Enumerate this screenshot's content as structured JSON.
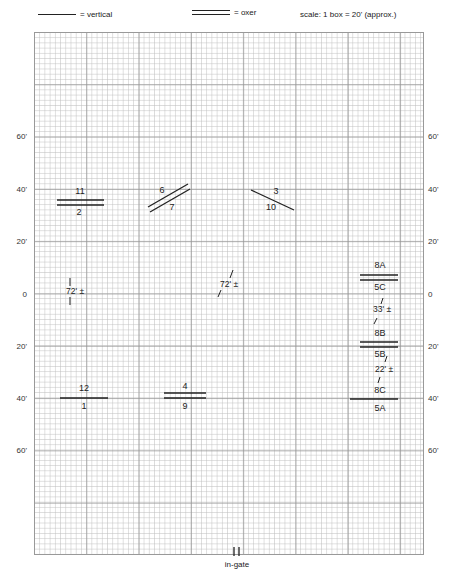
{
  "legend": {
    "vertical_label": "= vertical",
    "oxer_label": "= oxer",
    "scale_label": "scale: 1 box = 20' (approx.)"
  },
  "axis": {
    "left": [
      {
        "label": "60'",
        "y": 137
      },
      {
        "label": "40'",
        "y": 190
      },
      {
        "label": "20'",
        "y": 242
      },
      {
        "label": "0",
        "y": 295
      },
      {
        "label": "20'",
        "y": 347
      },
      {
        "label": "40'",
        "y": 399
      },
      {
        "label": "60'",
        "y": 451
      }
    ],
    "right": [
      {
        "label": "60'",
        "y": 137
      },
      {
        "label": "40'",
        "y": 190
      },
      {
        "label": "20'",
        "y": 242
      },
      {
        "label": "0",
        "y": 295
      },
      {
        "label": "20'",
        "y": 347
      },
      {
        "label": "40'",
        "y": 399
      },
      {
        "label": "60'",
        "y": 451
      }
    ]
  },
  "fences": [
    {
      "id": "11-2",
      "type": "oxer",
      "top_label": "11",
      "bottom_label": "2"
    },
    {
      "id": "6-7",
      "type": "oxer",
      "top_label": "6",
      "bottom_label": "7"
    },
    {
      "id": "3-10",
      "type": "vertical",
      "top_label": "3",
      "bottom_label": "10"
    },
    {
      "id": "8A-5C",
      "type": "oxer",
      "top_label": "8A",
      "bottom_label": "5C"
    },
    {
      "id": "8B-5B",
      "type": "oxer",
      "top_label": "8B",
      "bottom_label": "5B"
    },
    {
      "id": "8C-5A",
      "type": "vertical",
      "top_label": "8C",
      "bottom_label": "5A"
    },
    {
      "id": "12-1",
      "type": "vertical",
      "top_label": "12",
      "bottom_label": "1"
    },
    {
      "id": "4-9",
      "type": "oxer",
      "top_label": "4",
      "bottom_label": "9"
    }
  ],
  "distances": [
    {
      "id": "left-line",
      "label": "72' ±"
    },
    {
      "id": "center-line",
      "label": "72' ±"
    },
    {
      "id": "combo-a-b",
      "label": "33' ±"
    },
    {
      "id": "combo-b-c",
      "label": "22' ±"
    }
  ],
  "gate": {
    "label": "in-gate"
  },
  "colors": {
    "ink": "#222222",
    "grid_major": "#969696",
    "grid_minor": "#bebebe",
    "background": "#ffffff"
  }
}
